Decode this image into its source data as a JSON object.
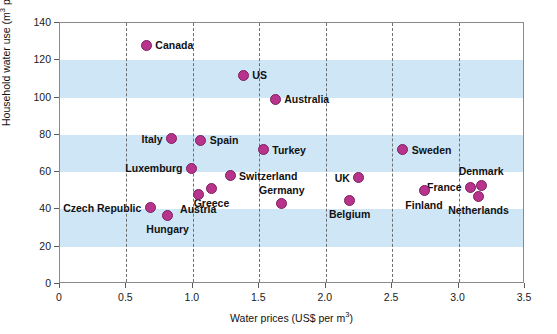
{
  "chart_data": {
    "type": "scatter",
    "title": "",
    "xlabel": "Water prices (US$ per m3)",
    "ylabel": "Household water use (m3 per person year)",
    "xlim": [
      0,
      3.5
    ],
    "ylim": [
      0,
      140
    ],
    "xticks": [
      "0",
      "0.5",
      "1.0",
      "1.5",
      "2.0",
      "2.5",
      "3.0",
      "3.5"
    ],
    "xtick_values": [
      0,
      0.5,
      1.0,
      1.5,
      2.0,
      2.5,
      3.0,
      3.5
    ],
    "yticks": [
      "0",
      "20",
      "40",
      "60",
      "80",
      "100",
      "120",
      "140"
    ],
    "ytick_values": [
      0,
      20,
      40,
      60,
      80,
      100,
      120,
      140
    ],
    "grid": "vertical dashed gridlines at each x tick; horizontal alternating light-blue shaded bands",
    "shaded_bands": [
      {
        "from": 20,
        "to": 40
      },
      {
        "from": 60,
        "to": 80
      },
      {
        "from": 100,
        "to": 120
      }
    ],
    "legend": "none",
    "marker_color": "#b8338c",
    "band_color": "#cfe6f7",
    "points": [
      {
        "label": "Canada",
        "x": 0.65,
        "y": 128,
        "label_pos": "right"
      },
      {
        "label": "US",
        "x": 1.38,
        "y": 112,
        "label_pos": "right"
      },
      {
        "label": "Australia",
        "x": 1.62,
        "y": 99,
        "label_pos": "right"
      },
      {
        "label": "Italy",
        "x": 0.84,
        "y": 78,
        "label_pos": "left"
      },
      {
        "label": "Spain",
        "x": 1.06,
        "y": 77,
        "label_pos": "right"
      },
      {
        "label": "Turkey",
        "x": 1.53,
        "y": 72,
        "label_pos": "right"
      },
      {
        "label": "Sweden",
        "x": 2.58,
        "y": 72,
        "label_pos": "right"
      },
      {
        "label": "Luxemburg",
        "x": 0.99,
        "y": 62,
        "label_pos": "left"
      },
      {
        "label": "Switzerland",
        "x": 1.28,
        "y": 58,
        "label_pos": "right"
      },
      {
        "label": "UK",
        "x": 2.25,
        "y": 57,
        "label_pos": "left"
      },
      {
        "label": "Greece",
        "x": 1.14,
        "y": 51,
        "label_pos": "below"
      },
      {
        "label": "Denmark",
        "x": 3.17,
        "y": 53,
        "label_pos": "above"
      },
      {
        "label": "France",
        "x": 3.09,
        "y": 52,
        "label_pos": "left"
      },
      {
        "label": "Austria",
        "x": 1.04,
        "y": 48,
        "label_pos": "below"
      },
      {
        "label": "Netherlands",
        "x": 3.15,
        "y": 47,
        "label_pos": "below"
      },
      {
        "label": "Belgium",
        "x": 2.18,
        "y": 45,
        "label_pos": "below"
      },
      {
        "label": "Germany",
        "x": 1.67,
        "y": 43,
        "label_pos": "above"
      },
      {
        "label": "Czech Republic",
        "x": 0.68,
        "y": 41,
        "label_pos": "left"
      },
      {
        "label": "Finland",
        "x": 2.74,
        "y": 50,
        "label_pos": "below"
      },
      {
        "label": "Hungary",
        "x": 0.81,
        "y": 37,
        "label_pos": "below"
      }
    ]
  },
  "axis": {
    "x_title_prefix": "Water prices (US$ per m",
    "x_title_exponent": "3",
    "x_title_suffix": ")",
    "y_title_prefix": "Household water use (m",
    "y_title_exponent": "3",
    "y_title_suffix": " per person year)"
  }
}
